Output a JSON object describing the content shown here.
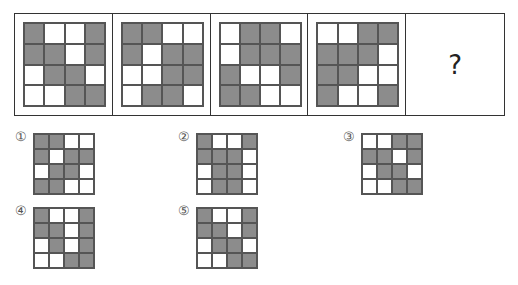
{
  "question_mark": "?",
  "sequence": [
    {
      "cells": [
        "G",
        "W",
        "W",
        "G",
        "G",
        "G",
        "W",
        "G",
        "W",
        "G",
        "G",
        "W",
        "W",
        "W",
        "G",
        "G"
      ]
    },
    {
      "cells": [
        "G",
        "G",
        "W",
        "W",
        "G",
        "W",
        "G",
        "G",
        "W",
        "W",
        "G",
        "G",
        "W",
        "G",
        "G",
        "W"
      ]
    },
    {
      "cells": [
        "W",
        "G",
        "G",
        "W",
        "W",
        "G",
        "G",
        "G",
        "G",
        "W",
        "W",
        "G",
        "G",
        "G",
        "W",
        "W"
      ]
    },
    {
      "cells": [
        "W",
        "W",
        "G",
        "G",
        "G",
        "G",
        "G",
        "W",
        "G",
        "G",
        "W",
        "W",
        "G",
        "W",
        "W",
        "G"
      ]
    }
  ],
  "options": [
    {
      "label": "①",
      "cells": [
        "G",
        "G",
        "W",
        "W",
        "G",
        "W",
        "G",
        "G",
        "W",
        "G",
        "G",
        "W",
        "G",
        "G",
        "W",
        "W"
      ]
    },
    {
      "label": "②",
      "cells": [
        "G",
        "W",
        "W",
        "G",
        "G",
        "G",
        "G",
        "W",
        "W",
        "G",
        "G",
        "W",
        "W",
        "G",
        "G",
        "W"
      ]
    },
    {
      "label": "③",
      "cells": [
        "W",
        "W",
        "G",
        "G",
        "G",
        "G",
        "W",
        "G",
        "W",
        "G",
        "G",
        "W",
        "W",
        "W",
        "G",
        "G"
      ]
    },
    {
      "label": "④",
      "cells": [
        "G",
        "W",
        "W",
        "G",
        "G",
        "G",
        "W",
        "G",
        "W",
        "G",
        "W",
        "G",
        "W",
        "W",
        "G",
        "G"
      ]
    },
    {
      "label": "⑤",
      "cells": [
        "G",
        "W",
        "W",
        "G",
        "G",
        "G",
        "W",
        "G",
        "W",
        "G",
        "G",
        "W",
        "W",
        "W",
        "G",
        "G"
      ]
    }
  ],
  "colors": {
    "gray": "#8c8c8c",
    "white": "#ffffff",
    "border": "#333333"
  }
}
